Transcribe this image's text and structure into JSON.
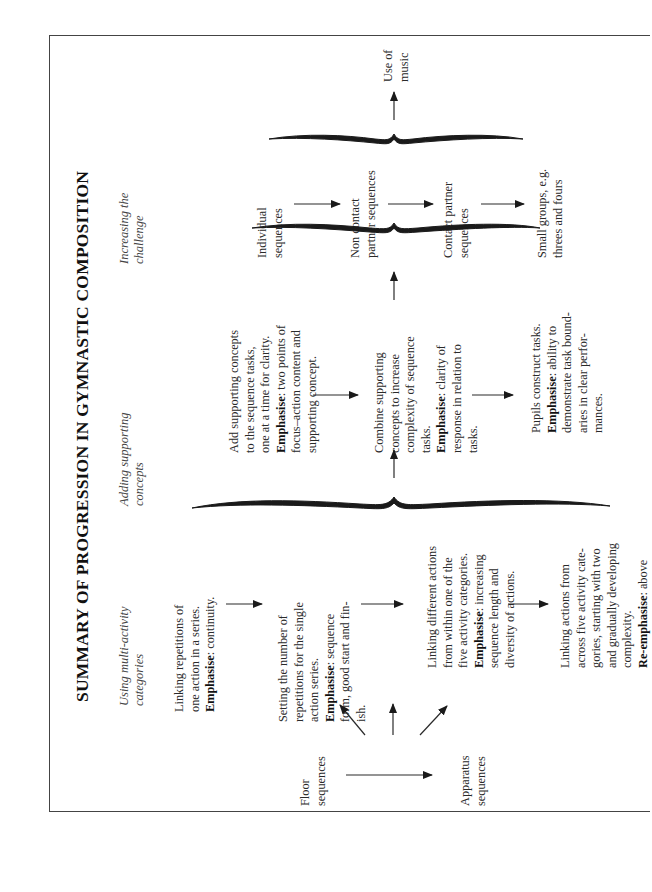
{
  "title": "SUMMARY OF PROGRESSION IN GYMNASTIC COMPOSITION",
  "columns": [
    {
      "header": [
        "Using multi-activity",
        "categories"
      ]
    },
    {
      "header": [
        "Adding supporting",
        "concepts"
      ]
    },
    {
      "header": [
        "Increasing the",
        "challenge"
      ]
    }
  ],
  "start_nodes": {
    "floor": [
      "Floor",
      "sequences"
    ],
    "apparatus": [
      "Apparatus",
      "sequences"
    ]
  },
  "multi_activity_steps": [
    {
      "lines": [
        "Linking repetitions of",
        "one action in a series."
      ],
      "emphasis_label": "Emphasise",
      "emphasis_lines": [
        ":  continuity."
      ]
    },
    {
      "lines": [
        "Setting the number of",
        "repetitions for the single",
        "action series."
      ],
      "emphasis_label": "Emphasise",
      "emphasis_lines": [
        ": sequence",
        "form, good start and fin-",
        "ish."
      ]
    },
    {
      "lines": [
        "Linking different actions",
        "from within one of the",
        "five activity categories."
      ],
      "emphasis_label": "Emphasise",
      "emphasis_lines": [
        ": increasing",
        "sequence length and",
        "diversity of actions."
      ]
    },
    {
      "lines": [
        "Linking actions from",
        "across five activity cate-",
        "gories, starting with two",
        "and gradually developing",
        "complexity."
      ],
      "emphasis_label": "Re-emphasise",
      "emphasis_lines": [
        ": above"
      ]
    }
  ],
  "supporting_concept_steps": [
    {
      "lines": [
        "Add supporting concepts",
        "to the sequence tasks,",
        "one at a time for clarity."
      ],
      "emphasis_label": "Emphasise",
      "emphasis_lines": [
        ": two points of",
        "focus–action content and",
        "supporting concept."
      ]
    },
    {
      "lines": [
        "Combine supporting",
        "concepts to increase",
        "complexity of sequence",
        "tasks."
      ],
      "emphasis_label": "Emphasise",
      "emphasis_lines": [
        ": clarity of",
        "response in relation to",
        "tasks."
      ]
    },
    {
      "lines": [
        "Pupils construct tasks."
      ],
      "emphasis_label": "Emphasise",
      "emphasis_lines": [
        ": ability to",
        "demonstrate task bound-",
        "aries in clear perfor-",
        "mances."
      ]
    }
  ],
  "challenge_steps": [
    {
      "lines": [
        "Individual",
        "sequences"
      ]
    },
    {
      "lines": [
        "Non contact",
        "partner sequences"
      ]
    },
    {
      "lines": [
        "Contact partner",
        "sequences"
      ]
    },
    {
      "lines": [
        "Small groups, e.g.",
        "threes and fours"
      ]
    }
  ],
  "final_node": {
    "lines": [
      "Use of",
      "music"
    ]
  },
  "colors": {
    "ink": "#222222",
    "border": "#444444",
    "background": "#ffffff"
  }
}
